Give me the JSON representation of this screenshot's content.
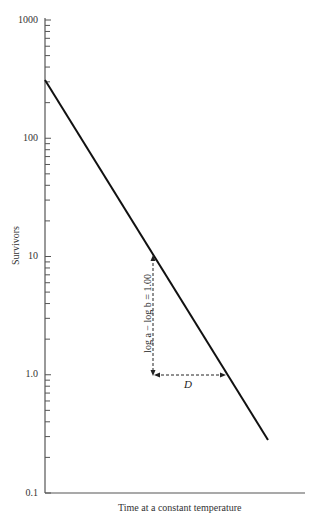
{
  "chart_data": {
    "type": "line",
    "title": "",
    "xlabel": "Time at a constant temperature",
    "ylabel": "Survivors",
    "yscale": "log",
    "ylim": [
      0.1,
      1000
    ],
    "ytick_labels": [
      "1000",
      "100",
      "10",
      "1.0",
      "0.1"
    ],
    "ytick_values": [
      1000,
      100,
      10,
      1.0,
      0.1
    ],
    "xticks": [],
    "grid": false,
    "legend": null,
    "series": [
      {
        "name": "Survivor curve",
        "x": [
          0,
          0.48,
          0.81,
          1.0
        ],
        "y": [
          300,
          10,
          1.0,
          0.28
        ]
      }
    ],
    "annotations": {
      "vertical": "log a − log b = 1.00",
      "horizontal": "D",
      "vertical_from": 10,
      "vertical_to": 1.0
    }
  }
}
